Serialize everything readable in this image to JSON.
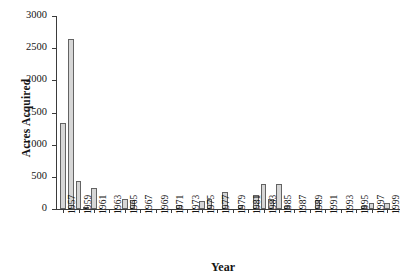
{
  "chart_data": {
    "type": "bar",
    "title": "",
    "subtitle": "",
    "xlabel": "Year",
    "ylabel": "Acres Acquired",
    "ylim": [
      0,
      3000
    ],
    "yticks": [
      0,
      500,
      1000,
      1500,
      2000,
      2500,
      3000
    ],
    "ytick_labels": [
      "0",
      "500",
      "1000",
      "1500",
      "2000",
      "2500",
      "3000"
    ],
    "xlim": [
      1957,
      2000
    ],
    "xtick_labels": [
      "1957",
      "1959",
      "1961",
      "1963",
      "1965",
      "1967",
      "1969",
      "1971",
      "1973",
      "1975",
      "1977",
      "1979",
      "1981",
      "1983",
      "1985",
      "1987",
      "1989",
      "1991",
      "1993",
      "1995",
      "1997",
      "1999"
    ],
    "grid": false,
    "legend": null,
    "bar_color": "#d6d6d6",
    "bar_edge_color": "#636363",
    "axis_color": "#3b3b3b",
    "categories": [
      "1957",
      "1958",
      "1959",
      "1960",
      "1961",
      "1962",
      "1963",
      "1964",
      "1965",
      "1966",
      "1967",
      "1968",
      "1969",
      "1970",
      "1971",
      "1972",
      "1973",
      "1974",
      "1975",
      "1976",
      "1977",
      "1978",
      "1979",
      "1980",
      "1981",
      "1982",
      "1983",
      "1984",
      "1985",
      "1986",
      "1987",
      "1988",
      "1989",
      "1990",
      "1991",
      "1992",
      "1993",
      "1994",
      "1995",
      "1996",
      "1997",
      "1998",
      "1999"
    ],
    "values": [
      1340,
      2650,
      430,
      35,
      330,
      0,
      0,
      0,
      160,
      135,
      0,
      0,
      0,
      0,
      0,
      55,
      0,
      0,
      120,
      155,
      0,
      270,
      0,
      55,
      0,
      225,
      390,
      155,
      390,
      40,
      0,
      0,
      0,
      140,
      0,
      0,
      0,
      0,
      0,
      50,
      90,
      0,
      95
    ]
  }
}
